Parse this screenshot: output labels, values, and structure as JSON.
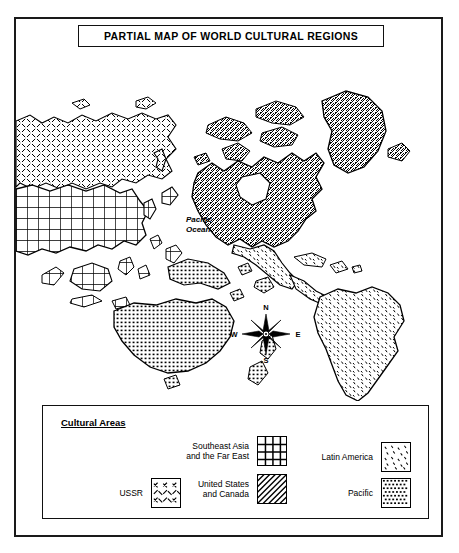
{
  "title": "PARTIAL MAP OF WORLD CULTURAL REGIONS",
  "ocean_label": "Pacific\nOcean",
  "ocean_label_line1": "Pacific",
  "ocean_label_line2": "Ocean",
  "compass": {
    "north": "N",
    "south": "S",
    "east": "E",
    "west": "W"
  },
  "legend": {
    "heading": "Cultural Areas",
    "entries": [
      {
        "label": "Southeast Asia and the Far East",
        "line1": "Southeast Asia",
        "line2": "and the Far East",
        "pattern": "grid",
        "region": "southeast-asia-far-east"
      },
      {
        "label": "Latin America",
        "line1": "Latin America",
        "line2": "",
        "pattern": "stipple",
        "region": "latin-america"
      },
      {
        "label": "USSR",
        "line1": "USSR",
        "line2": "",
        "pattern": "dash-crosshatch",
        "region": "ussr"
      },
      {
        "label": "United States and Canada",
        "line1": "United States",
        "line2": "and Canada",
        "pattern": "diagonal-hatch",
        "region": "united-states-canada"
      },
      {
        "label": "Pacific",
        "line1": "Pacific",
        "line2": "",
        "pattern": "dense-dot",
        "region": "pacific"
      }
    ]
  },
  "colors": {
    "ink": "#000000",
    "frame": "#1a1a1a",
    "paper": "#ffffff"
  }
}
